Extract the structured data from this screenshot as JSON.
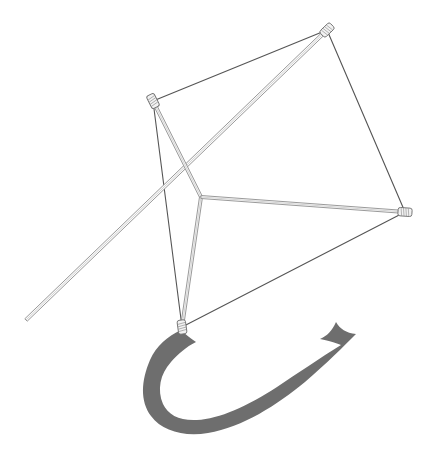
{
  "scene": {
    "title": "Kite line drawing",
    "subject": "kite",
    "style": "pen-and-ink line drawing with shaded tail",
    "background_color": "#ffffff",
    "canvas": {
      "width": 430,
      "height": 459
    }
  },
  "palette": {
    "background": "#ffffff",
    "sail_edge_line": "#555555",
    "spar_outline": "#8e8e8e",
    "spar_fill": "#fbfbfb",
    "knot_outline": "#6d6d6d",
    "knot_fill": "#f2f2f2",
    "tail_gray": "#6e6e6e"
  },
  "kite": {
    "vertices": {
      "top": {
        "label": "top corner",
        "x": 327,
        "y": 30
      },
      "left": {
        "label": "left corner",
        "x": 153,
        "y": 101
      },
      "right": {
        "label": "right corner",
        "x": 405,
        "y": 212
      },
      "bottom": {
        "label": "bottom corner",
        "x": 182,
        "y": 327
      },
      "center": {
        "label": "spar junction",
        "x": 201,
        "y": 197
      }
    },
    "sail_edges": [
      {
        "name": "edge-top-left",
        "from": "left",
        "to": "top"
      },
      {
        "name": "edge-top-right",
        "from": "top",
        "to": "right"
      },
      {
        "name": "edge-bottom-right",
        "from": "right",
        "to": "bottom"
      },
      {
        "name": "edge-bottom-left",
        "from": "bottom",
        "to": "left"
      }
    ],
    "spars": [
      {
        "name": "spar-long-diagonal",
        "from_x": 327,
        "from_y": 30,
        "to_x": 26,
        "to_y": 320,
        "width": 3.4
      },
      {
        "name": "spar-cross-left",
        "from_x": 153,
        "from_y": 101,
        "to_x": 201,
        "to_y": 197,
        "width": 3.0
      },
      {
        "name": "spar-cross-bottom",
        "from_x": 201,
        "from_y": 197,
        "to_x": 182,
        "to_y": 327,
        "width": 3.0
      },
      {
        "name": "spar-cross-right",
        "from_x": 201,
        "from_y": 197,
        "to_x": 405,
        "to_y": 212,
        "width": 3.0
      }
    ],
    "lashings": [
      {
        "name": "lashing-top",
        "x": 327,
        "y": 30,
        "angle": -44
      },
      {
        "name": "lashing-left",
        "x": 153,
        "y": 101,
        "angle": 63
      },
      {
        "name": "lashing-right",
        "x": 405,
        "y": 212,
        "angle": 4
      },
      {
        "name": "lashing-bottom",
        "x": 182,
        "y": 327,
        "angle": 82
      }
    ]
  },
  "tail": {
    "name": "kite-tail-ribbon",
    "color": "#6e6e6e",
    "attachment_x": 182,
    "attachment_y": 331,
    "end_style": "swallowtail fork",
    "path": "M 181 330 C 168 336 156 346 150 360 C 141 381 140 401 151 416 C 162 431 184 437 208 433 C 243 427 277 405 305 382 C 327 363 343 347 356 334 C 346 333 340 329 336 322 C 332 331 327 336 320 339 C 330 341 336 343 341 345 C 320 358 298 373 277 387 C 248 406 219 419 197 420 C 180 421 168 415 163 404 C 157 390 160 374 171 362 C 178 354 186 347 196 342 C 190 338 185 334 181 330 Z"
  }
}
